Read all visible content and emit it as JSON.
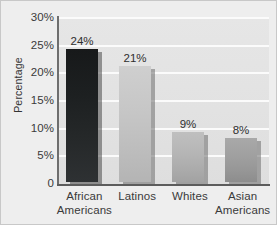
{
  "chart_data": {
    "type": "bar",
    "title": "",
    "xlabel": "",
    "ylabel": "Percentage",
    "categories": [
      "African Americans",
      "Latinos",
      "Whites",
      "Asian Americans"
    ],
    "category_lines": [
      [
        "African",
        "Americans"
      ],
      [
        "Latinos"
      ],
      [
        "Whites"
      ],
      [
        "Asian",
        "Americans"
      ]
    ],
    "values": [
      24,
      21,
      9,
      8
    ],
    "value_labels": [
      "24%",
      "21%",
      "9%",
      "8%"
    ],
    "ylim": [
      0,
      30
    ],
    "yticks": [
      0,
      5,
      10,
      15,
      20,
      25,
      30
    ],
    "ytick_labels": [
      "0",
      "5%",
      "10%",
      "15%",
      "20%",
      "25%",
      "30%"
    ],
    "grid": "horizontal",
    "legend": "none",
    "bar_colors": [
      "#1d2021",
      "#c6c6c6",
      "#b6b6b6",
      "#a0a0a0"
    ],
    "plot_background": "#e2e2e2",
    "gridline_color": "#fbfbfb",
    "figure_background": "#eeeeee",
    "axis_color": "#5c5c5c"
  }
}
